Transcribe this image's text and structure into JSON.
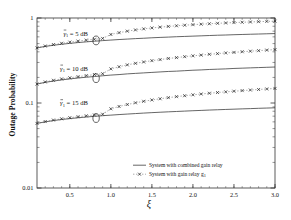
{
  "chart_data": {
    "type": "line",
    "title": "",
    "xlabel": "ξ",
    "ylabel": "Outage Probability",
    "xlim": [
      0.1,
      3.0
    ],
    "ylim": [
      0.01,
      1.0
    ],
    "yscale": "log",
    "xscale": "linear",
    "grid": false,
    "xticks": [
      0.5,
      1.0,
      1.5,
      2.0,
      2.5,
      3.0
    ],
    "xticklabels": [
      "0.5",
      "1.0",
      "1.5",
      "2.0",
      "2.5",
      "3.0"
    ],
    "yticks": [
      0.01,
      0.1,
      1
    ],
    "yticklabels": [
      "0.01",
      "0.1",
      "1"
    ],
    "legend_position": "lower right",
    "legend": [
      "System with combined gain relay",
      "System with gain relay g"
    ],
    "legend_subscripts": [
      "",
      "1"
    ],
    "annotations": [
      {
        "text": "γ̅1 = 5 dB",
        "gamma": "γ",
        "sub": "1",
        "value": "5 dB",
        "x": 0.72,
        "y": 0.62
      },
      {
        "text": "γ̅1 = 10 dB",
        "gamma": "γ",
        "sub": "1",
        "value": "10 dB",
        "x": 0.72,
        "y": 0.24
      },
      {
        "text": "γ̅1 = 15 dB",
        "gamma": "γ",
        "sub": "1",
        "value": "15 dB",
        "x": 0.72,
        "y": 0.094
      }
    ],
    "circle_markers": [
      {
        "x": 0.82,
        "y": 0.545
      },
      {
        "x": 0.82,
        "y": 0.196
      },
      {
        "x": 0.82,
        "y": 0.0665
      }
    ],
    "x": [
      0.1,
      0.2,
      0.3,
      0.4,
      0.5,
      0.6,
      0.7,
      0.8,
      0.9,
      1.0,
      1.1,
      1.2,
      1.3,
      1.4,
      1.5,
      1.6,
      1.7,
      1.8,
      1.9,
      2.0,
      2.1,
      2.2,
      2.3,
      2.4,
      2.5,
      2.6,
      2.7,
      2.8,
      2.9,
      3.0
    ],
    "series": [
      {
        "name": "System with combined gain relay, 5 dB",
        "style": "solid",
        "values": [
          0.445,
          0.463,
          0.478,
          0.491,
          0.503,
          0.514,
          0.524,
          0.533,
          0.542,
          0.55,
          0.558,
          0.565,
          0.572,
          0.578,
          0.585,
          0.591,
          0.596,
          0.602,
          0.607,
          0.612,
          0.617,
          0.622,
          0.627,
          0.631,
          0.636,
          0.64,
          0.644,
          0.648,
          0.652,
          0.656
        ]
      },
      {
        "name": "System with gain relay g1, 5 dB",
        "style": "dashed-x",
        "values": [
          0.445,
          0.468,
          0.487,
          0.504,
          0.52,
          0.535,
          0.549,
          0.562,
          0.575,
          0.64,
          0.672,
          0.7,
          0.724,
          0.745,
          0.764,
          0.781,
          0.796,
          0.81,
          0.823,
          0.835,
          0.846,
          0.856,
          0.866,
          0.875,
          0.883,
          0.891,
          0.898,
          0.905,
          0.912,
          0.918
        ]
      },
      {
        "name": "System with combined gain relay, 10 dB",
        "style": "solid",
        "values": [
          0.167,
          0.175,
          0.181,
          0.187,
          0.192,
          0.197,
          0.201,
          0.205,
          0.209,
          0.213,
          0.216,
          0.22,
          0.223,
          0.226,
          0.229,
          0.232,
          0.235,
          0.237,
          0.24,
          0.243,
          0.245,
          0.248,
          0.25,
          0.252,
          0.255,
          0.257,
          0.259,
          0.261,
          0.263,
          0.265
        ]
      },
      {
        "name": "System with gain relay g1, 10 dB",
        "style": "dashed-x",
        "values": [
          0.167,
          0.177,
          0.185,
          0.192,
          0.198,
          0.204,
          0.21,
          0.216,
          0.221,
          0.252,
          0.267,
          0.281,
          0.293,
          0.304,
          0.315,
          0.324,
          0.334,
          0.342,
          0.351,
          0.359,
          0.366,
          0.374,
          0.381,
          0.388,
          0.394,
          0.401,
          0.407,
          0.413,
          0.419,
          0.425
        ]
      },
      {
        "name": "System with combined gain relay, 15 dB",
        "style": "solid",
        "values": [
          0.0575,
          0.06,
          0.0621,
          0.0639,
          0.0655,
          0.067,
          0.0684,
          0.0697,
          0.0709,
          0.072,
          0.0731,
          0.0741,
          0.0751,
          0.0761,
          0.077,
          0.0779,
          0.0787,
          0.0795,
          0.0803,
          0.0811,
          0.0818,
          0.0826,
          0.0833,
          0.084,
          0.0846,
          0.0853,
          0.0859,
          0.0866,
          0.0872,
          0.0878
        ]
      },
      {
        "name": "System with gain relay g1, 15 dB",
        "style": "dashed-x",
        "values": [
          0.0575,
          0.0605,
          0.063,
          0.0652,
          0.0672,
          0.069,
          0.0707,
          0.0723,
          0.0738,
          0.0855,
          0.091,
          0.096,
          0.1005,
          0.1047,
          0.1086,
          0.1122,
          0.1156,
          0.1188,
          0.1219,
          0.1248,
          0.1276,
          0.1302,
          0.1328,
          0.1352,
          0.1376,
          0.1399,
          0.1421,
          0.1442,
          0.1463,
          0.1483
        ]
      }
    ]
  }
}
